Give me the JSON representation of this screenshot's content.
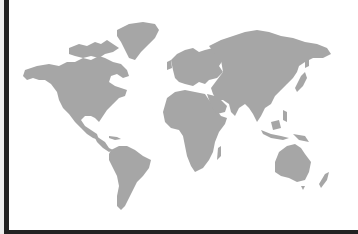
{
  "map": {
    "type": "world-map-silhouette",
    "land_color": "#a6a6a6",
    "background_color": "#ffffff",
    "frame_color": "#222222",
    "continents": [
      "North America",
      "Greenland",
      "South America",
      "Europe",
      "Africa",
      "Asia",
      "Australia",
      "New Zealand",
      "Madagascar",
      "Japan",
      "Indonesia"
    ]
  }
}
